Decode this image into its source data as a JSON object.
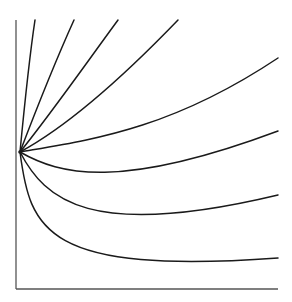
{
  "diagram": {
    "type": "family-of-curves",
    "colors": {
      "axis": "#555555",
      "curve": "#1a1a1a",
      "background": "#ffffff"
    },
    "axes": {
      "y_axis": {
        "x": 16,
        "y_top": 20,
        "y_bottom": 289
      },
      "x_axis": {
        "y": 289,
        "x_left": 16,
        "x_right": 278
      }
    },
    "origin_point": {
      "x": 20,
      "y": 152
    },
    "curves": [
      {
        "id": "curve-1",
        "end": "top",
        "path": "M20,152 C24,110 29,60 35,20"
      },
      {
        "id": "curve-2",
        "end": "top",
        "path": "M20,152 C36,110 55,62 74,20"
      },
      {
        "id": "curve-3",
        "end": "top",
        "path": "M20,152 C50,115 85,65 118,20"
      },
      {
        "id": "curve-4",
        "end": "top",
        "path": "M20,152 C70,125 125,75 178,20"
      },
      {
        "id": "curve-5",
        "end": "right",
        "path": "M20,152 C90,140 170,130 278,58"
      },
      {
        "id": "curve-6",
        "end": "right",
        "path": "M20,152 C60,175 120,190 278,131"
      },
      {
        "id": "curve-7",
        "end": "right",
        "path": "M20,152 C45,200 90,240 278,195"
      },
      {
        "id": "curve-8",
        "end": "right",
        "path": "M20,152 C30,230 45,275 278,258"
      }
    ]
  }
}
